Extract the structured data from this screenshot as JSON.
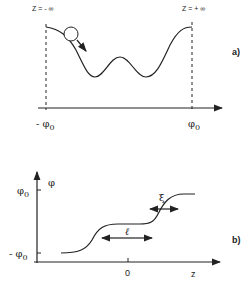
{
  "panel_a": {
    "tag": "a)",
    "label_left_top": "Z = - ∞",
    "label_right_top": "Z = + ∞",
    "x_label_left": "- φ",
    "x_label_left_sub": "0",
    "x_label_right": "φ",
    "x_label_right_sub": "0",
    "description": "Double-well inverted potential with ball rolling from -φ0 toward +φ0"
  },
  "panel_b": {
    "tag": "b)",
    "y_axis_label": "φ",
    "y_tick_top": "φ",
    "y_tick_top_sub": "0",
    "y_tick_bottom": "- φ",
    "y_tick_bottom_sub": "0",
    "x_axis_label": "z",
    "x_tick_zero": "0",
    "width_label_xi": "ξ",
    "width_label_l": "ℓ",
    "description": "Kink profile φ(z) with two steps of width ξ separated by distance ℓ"
  },
  "colors": {
    "ink": "#222222",
    "background": "#ffffff"
  }
}
